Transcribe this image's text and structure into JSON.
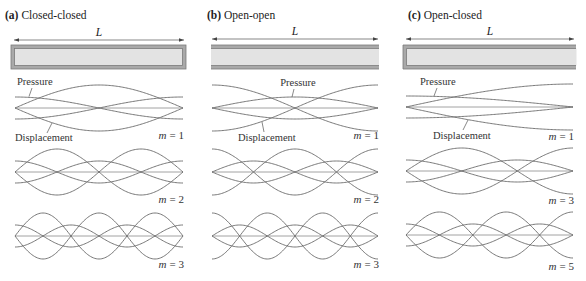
{
  "figure": {
    "colors": {
      "curve": "#6a6a6a",
      "axis": "#8c8c8c",
      "tube_wall": "#a9a9a9",
      "tube_fill": "#e3e3e3"
    },
    "panels": [
      {
        "letter": "(a)",
        "title": "Closed-closed",
        "length_label": "L",
        "ends": {
          "left": "closed",
          "right": "closed"
        },
        "pressure_label": "Pressure",
        "displacement_label": "Displacement",
        "modes": [
          {
            "m": 1,
            "symbol": "m",
            "equals": "= 1"
          },
          {
            "m": 2,
            "symbol": "m",
            "equals": "= 2"
          },
          {
            "m": 3,
            "symbol": "m",
            "equals": "= 3"
          }
        ]
      },
      {
        "letter": "(b)",
        "title": "Open-open",
        "length_label": "L",
        "ends": {
          "left": "open",
          "right": "open"
        },
        "pressure_label": "Pressure",
        "displacement_label": "Displacement",
        "modes": [
          {
            "m": 1,
            "symbol": "m",
            "equals": "= 1"
          },
          {
            "m": 2,
            "symbol": "m",
            "equals": "= 2"
          },
          {
            "m": 3,
            "symbol": "m",
            "equals": "= 3"
          }
        ]
      },
      {
        "letter": "(c)",
        "title": "Open-closed",
        "length_label": "L",
        "ends": {
          "left": "closed",
          "right": "open"
        },
        "pressure_label": "Pressure",
        "displacement_label": "Displacement",
        "modes": [
          {
            "m": 1,
            "symbol": "m",
            "equals": "= 1"
          },
          {
            "m": 3,
            "symbol": "m",
            "equals": "= 3"
          },
          {
            "m": 5,
            "symbol": "m",
            "equals": "= 5"
          }
        ]
      }
    ]
  }
}
